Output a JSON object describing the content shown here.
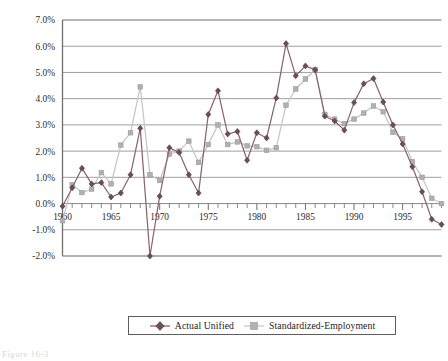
{
  "figure": {
    "caption": "Figure 16-3"
  },
  "legend": {
    "items": [
      {
        "label": "Actual Unified",
        "color": "#7d5a63",
        "marker": "diamond-marker"
      },
      {
        "label": "Standardized-Employment",
        "color": "#b9b9b9",
        "marker": "square-marker"
      }
    ]
  },
  "chart_data": {
    "type": "line",
    "title": "",
    "xlabel": "",
    "ylabel": "",
    "xlim": [
      1960,
      1999
    ],
    "ylim": [
      -2.0,
      7.0
    ],
    "ytick_step": 1.0,
    "grid": true,
    "grid_axis": "y",
    "legend_position": "bottom",
    "ytick_labels": [
      "7.0%",
      "6.0%",
      "5.0%",
      "4.0%",
      "3.0%",
      "2.0%",
      "1.0%",
      "0.0%",
      "-1.0%",
      "-2.0%"
    ],
    "ytick_values": [
      7.0,
      6.0,
      5.0,
      4.0,
      3.0,
      2.0,
      1.0,
      0.0,
      -1.0,
      -2.0
    ],
    "xtick_labels": [
      "1960",
      "1965",
      "1970",
      "1975",
      "1980",
      "1985",
      "1990",
      "1995"
    ],
    "xtick_values": [
      1960,
      1965,
      1970,
      1975,
      1980,
      1985,
      1990,
      1995
    ],
    "xtick_minor_step": 1,
    "x": [
      1960,
      1961,
      1962,
      1963,
      1964,
      1965,
      1966,
      1967,
      1968,
      1969,
      1970,
      1971,
      1972,
      1973,
      1974,
      1975,
      1976,
      1977,
      1978,
      1979,
      1980,
      1981,
      1982,
      1983,
      1984,
      1985,
      1986,
      1987,
      1988,
      1989,
      1990,
      1991,
      1992,
      1993,
      1994,
      1995,
      1996,
      1997,
      1998,
      1999
    ],
    "series": [
      {
        "name": "Actual Unified",
        "color": "#7d5a63",
        "marker": "diamond-marker",
        "values": [
          -0.1,
          0.6,
          1.35,
          0.75,
          0.8,
          0.25,
          0.4,
          1.1,
          2.87,
          -2.0,
          0.28,
          2.13,
          1.95,
          1.1,
          0.4,
          3.4,
          4.3,
          2.65,
          2.75,
          1.65,
          2.7,
          2.5,
          4.03,
          6.1,
          4.87,
          5.25,
          5.1,
          3.33,
          3.15,
          2.8,
          3.85,
          4.57,
          4.77,
          3.87,
          3.0,
          2.27,
          1.4,
          0.45,
          -0.6,
          -0.8
        ]
      },
      {
        "name": "Standardized-Employment",
        "color": "#b9b9b9",
        "marker": "square-marker",
        "values": [
          -0.65,
          0.72,
          0.42,
          0.55,
          1.18,
          0.75,
          2.23,
          2.7,
          4.45,
          1.1,
          0.88,
          1.88,
          2.0,
          2.38,
          1.57,
          2.25,
          3.0,
          2.25,
          2.35,
          2.2,
          2.17,
          2.03,
          2.13,
          3.75,
          4.37,
          4.75,
          5.1,
          3.4,
          3.22,
          3.05,
          3.22,
          3.45,
          3.72,
          3.5,
          2.72,
          2.47,
          1.6,
          1.0,
          0.2,
          0.0
        ]
      }
    ]
  }
}
